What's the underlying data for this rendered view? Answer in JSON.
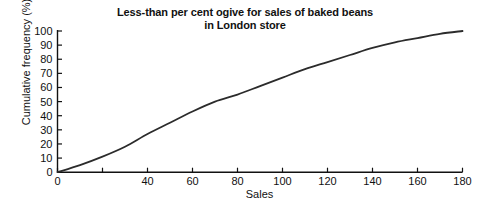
{
  "chart_data": {
    "type": "line",
    "title": "Less-than per cent ogive for sales of baked beans in London store",
    "title_lines": [
      "Less-than per cent ogive for sales of baked beans",
      "in London store"
    ],
    "xlabel": "Sales",
    "ylabel": "Cumulative frequency (%)",
    "xlim": [
      0,
      180
    ],
    "ylim": [
      0,
      100
    ],
    "grid": false,
    "legend": null,
    "x_ticks": [
      0,
      20,
      40,
      60,
      80,
      100,
      120,
      140,
      160,
      180
    ],
    "x_tick_labels": [
      "0",
      "",
      "40",
      "60",
      "80",
      "100",
      "120",
      "140",
      "160",
      "180"
    ],
    "y_ticks": [
      0,
      10,
      20,
      30,
      40,
      50,
      60,
      70,
      80,
      90,
      100
    ],
    "y_tick_labels": [
      "0",
      "10",
      "20",
      "30",
      "40",
      "50",
      "60",
      "70",
      "80",
      "90",
      "100"
    ],
    "series": [
      {
        "name": "Cumulative frequency",
        "color": "#2b2b2b",
        "x": [
          0,
          10,
          20,
          30,
          40,
          50,
          60,
          70,
          80,
          90,
          100,
          110,
          120,
          130,
          140,
          150,
          160,
          170,
          180
        ],
        "y": [
          0,
          5,
          11,
          18,
          27,
          35,
          43,
          50,
          55,
          61,
          67,
          73,
          78,
          83,
          88,
          92,
          95,
          98,
          100
        ]
      }
    ]
  },
  "axes": {
    "spine_color": "#111111",
    "tick_color": "#111111"
  }
}
